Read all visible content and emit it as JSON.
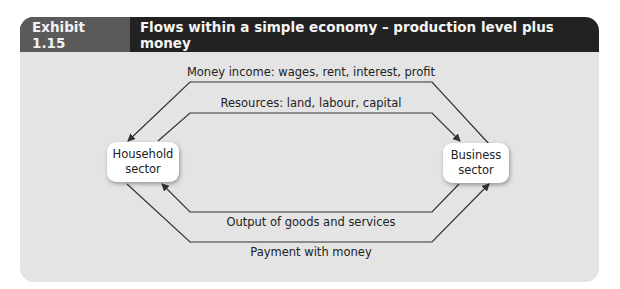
{
  "exhibit": {
    "number": "Exhibit 1.15",
    "title": "Flows within a simple economy – production level plus money"
  },
  "nodes": {
    "household": {
      "line1": "Household",
      "line2": "sector"
    },
    "business": {
      "line1": "Business",
      "line2": "sector"
    }
  },
  "flows": [
    {
      "label": "Money income: wages, rent, interest, profit",
      "direction": "business-to-household"
    },
    {
      "label": "Resources: land, labour, capital",
      "direction": "household-to-business"
    },
    {
      "label": "Output of goods and services",
      "direction": "business-to-household"
    },
    {
      "label": "Payment with money",
      "direction": "household-to-business"
    }
  ],
  "colors": {
    "header_dark": "#222222",
    "header_number_bg": "#5a5a5a",
    "panel_bg": "#e4e4e4",
    "node_bg": "#ffffff",
    "line": "#333333"
  }
}
